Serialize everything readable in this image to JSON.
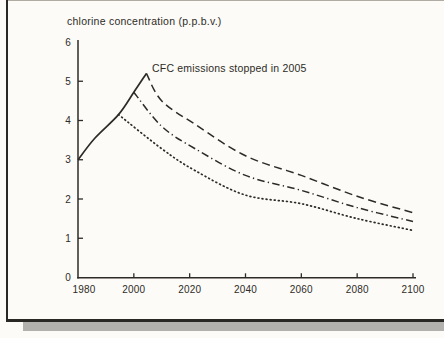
{
  "figure": {
    "title": "chlorine concentration (p.p.b.v.)",
    "annotation": "CFC emissions stopped in 2005",
    "ink_color": "#2e2b26",
    "paper_color": "#fcfbf8",
    "frame_color": "#2a2824",
    "shadow_color": "#b3b1ad"
  },
  "chart_data": {
    "type": "line",
    "title": "chlorine concentration (p.p.b.v.)",
    "annotation": "CFC emissions stopped in 2005",
    "xlim": [
      1980,
      2100
    ],
    "ylim": [
      0,
      6
    ],
    "x_ticks": [
      1980,
      2000,
      2020,
      2040,
      2060,
      2080,
      2100
    ],
    "y_ticks": [
      0,
      1,
      2,
      3,
      4,
      5,
      6
    ],
    "grid": false,
    "legend": "none",
    "series": [
      {
        "name": "historical-chlorine-rise",
        "style": "solid",
        "points": [
          [
            1980,
            3.0
          ],
          [
            1986,
            3.55
          ],
          [
            1994.5,
            4.15
          ],
          [
            2000,
            4.72
          ],
          [
            2004.5,
            5.2
          ]
        ]
      },
      {
        "name": "CFC emissions stopped in 2005",
        "style": "dashed",
        "points": [
          [
            2004.5,
            5.2
          ],
          [
            2010,
            4.5
          ],
          [
            2022,
            3.9
          ],
          [
            2040,
            3.1
          ],
          [
            2060,
            2.6
          ],
          [
            2080,
            2.07
          ],
          [
            2100,
            1.65
          ]
        ]
      },
      {
        "name": "dash-dot-projection",
        "style": "dash-dot",
        "points": [
          [
            2000,
            4.72
          ],
          [
            2010,
            3.85
          ],
          [
            2022,
            3.28
          ],
          [
            2040,
            2.6
          ],
          [
            2060,
            2.22
          ],
          [
            2080,
            1.78
          ],
          [
            2100,
            1.43
          ]
        ]
      },
      {
        "name": "dotted-projection",
        "style": "dotted",
        "points": [
          [
            1994.5,
            4.15
          ],
          [
            2010,
            3.28
          ],
          [
            2022,
            2.72
          ],
          [
            2040,
            2.1
          ],
          [
            2060,
            1.88
          ],
          [
            2080,
            1.5
          ],
          [
            2100,
            1.2
          ]
        ]
      }
    ]
  }
}
